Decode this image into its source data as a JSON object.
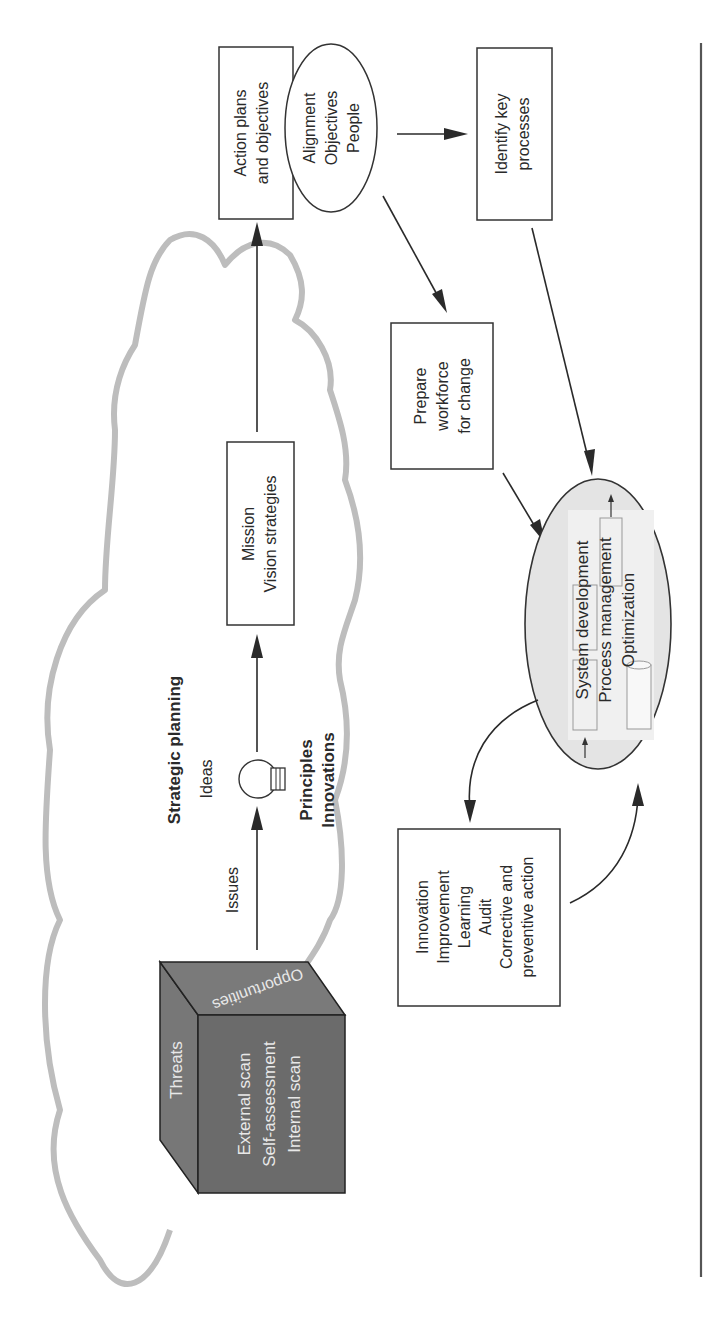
{
  "figure": {
    "orientation": "rotated-90-ccw",
    "colors": {
      "ink": "#2a2a2a",
      "cloud_outline": "#bdbdbd",
      "cube_front": "#6b6b6b",
      "cube_top": "#7a7a7a",
      "cube_side": "#777777",
      "cube_text": "#e8e8e8",
      "ellipse_fill": "#e4e4e4",
      "ellipse_inner": "#f0f0f0"
    },
    "cloud": {
      "title": "Strategic planning"
    },
    "cube": {
      "top_face": "Opportunities",
      "side_face": "Threats",
      "front_face_lines": [
        "External scan",
        "Self-assessment",
        "Internal scan"
      ]
    },
    "labels": {
      "issues": "Issues",
      "ideas": "Ideas",
      "principles": "Principles",
      "innovations": "Innovations"
    },
    "boxes": {
      "mission": [
        "Mission",
        "Vision strategies"
      ],
      "action_plans": [
        "Action plans",
        "and objectives"
      ],
      "identify_processes": [
        "Identify key",
        "processes"
      ],
      "prepare_workforce": [
        "Prepare",
        "workforce",
        "for change"
      ],
      "improvement": [
        "Innovation",
        "Improvement",
        "Learning",
        "Audit",
        "Corrective and",
        "preventive action"
      ]
    },
    "ellipses": {
      "alignment": [
        "Alignment",
        "Objectives",
        "People"
      ],
      "management_system": [
        "System development",
        "Process management",
        "Optimization"
      ]
    },
    "icons": {
      "lightbulb": "lightbulb-icon",
      "database": "database-cylinder-icon"
    }
  }
}
